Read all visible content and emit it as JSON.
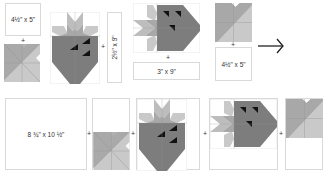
{
  "diagram": {
    "colors": {
      "dark_gray": "#7d7d7d",
      "mid_gray": "#a8a8a8",
      "light_gray": "#c9c9c9",
      "seed_black": "#111111",
      "outline": "#d9d9d9"
    },
    "top_row": {
      "box_a": {
        "label": "4½\" x 5\""
      },
      "plus_1": "+",
      "plus_2": "+",
      "box_b": {
        "label": "2½\" x 9\""
      },
      "plus_3": "+",
      "box_c": {
        "label": "3\" x 9\""
      },
      "plus_4": "+",
      "box_d": {
        "label": "4½\" x 5\""
      },
      "arrow": "arrow-right"
    },
    "bottom_row": {
      "box_e": {
        "label": "8 ¾\" x 10 ½\""
      },
      "plus_1": "+",
      "plus_2": "+",
      "plus_3": "+",
      "plus_4": "+"
    }
  }
}
